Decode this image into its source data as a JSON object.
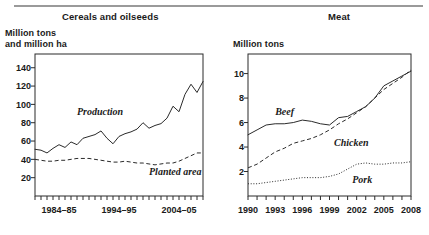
{
  "figure": {
    "width": 429,
    "height": 235,
    "background": "#ffffff",
    "rule_color": "#9a9a9a",
    "ink_color": "#2b2b2b"
  },
  "panels": {
    "left": {
      "title": "Cereals and oilseeds",
      "y_axis_label": "Million tons\nand million ha"
    },
    "right": {
      "title": "Meat",
      "y_axis_label": "Million tons"
    }
  },
  "chart_data": [
    {
      "type": "line",
      "title": "Cereals and oilseeds",
      "xlabel": "",
      "ylabel": "Million tons and million ha",
      "grid": false,
      "legend": "inline-annotations",
      "xlim": [
        1980,
        2008
      ],
      "ylim": [
        0,
        155
      ],
      "yticks": [
        20,
        40,
        60,
        80,
        100,
        120,
        140
      ],
      "ytick_labels": [
        "20",
        "40",
        "60",
        "80",
        "100",
        "120",
        "140"
      ],
      "x": [
        1980,
        1981,
        1982,
        1983,
        1984,
        1985,
        1986,
        1987,
        1988,
        1989,
        1990,
        1991,
        1992,
        1993,
        1994,
        1995,
        1996,
        1997,
        1998,
        1999,
        2000,
        2001,
        2002,
        2003,
        2004,
        2005,
        2006,
        2007,
        2008
      ],
      "xtick_labels": [
        "1984–85",
        "1994–95",
        "2004–05"
      ],
      "xtick_label_positions": [
        1984,
        1994,
        2004
      ],
      "xtick_note": "minor ticks every year across full range",
      "series": [
        {
          "name": "Production",
          "style": "solid",
          "values": [
            51,
            50,
            47,
            52,
            56,
            53,
            59,
            56,
            63,
            65,
            67,
            71,
            63,
            57,
            65,
            68,
            70,
            73,
            80,
            74,
            77,
            79,
            85,
            98,
            92,
            111,
            122,
            113,
            125,
            139
          ]
        },
        {
          "name": "Planted area",
          "style": "dashed",
          "values": [
            40,
            39,
            38,
            38,
            39,
            39,
            40,
            41,
            41,
            41,
            40,
            39,
            38,
            37,
            37,
            38,
            37,
            36,
            36,
            35,
            34,
            35,
            36,
            36,
            38,
            41,
            44,
            47,
            47,
            46
          ]
        }
      ],
      "annotations": [
        {
          "text": "Production",
          "x": 1987,
          "y": 88
        },
        {
          "text": "Planted area",
          "x": 1999,
          "y": 23
        }
      ]
    },
    {
      "type": "line",
      "title": "Meat",
      "xlabel": "",
      "ylabel": "Million tons",
      "grid": false,
      "legend": "inline-annotations",
      "xlim": [
        1990,
        2008
      ],
      "ylim": [
        0,
        11.6
      ],
      "yticks": [
        2,
        4,
        6,
        8,
        10
      ],
      "ytick_labels": [
        "2",
        "4",
        "6",
        "8",
        "10"
      ],
      "x": [
        1990,
        1991,
        1992,
        1993,
        1994,
        1995,
        1996,
        1997,
        1998,
        1999,
        2000,
        2001,
        2002,
        2003,
        2004,
        2005,
        2006,
        2007,
        2008
      ],
      "xtick_labels": [
        "1990",
        "1993",
        "1996",
        "1999",
        "2002",
        "2005",
        "2008"
      ],
      "xtick_label_positions": [
        1990,
        1993,
        1996,
        1999,
        2002,
        2005,
        2008
      ],
      "xtick_note": "minor ticks every year",
      "series": [
        {
          "name": "Beef",
          "style": "solid",
          "values": [
            5.0,
            5.4,
            5.8,
            5.9,
            5.9,
            6.0,
            6.2,
            6.1,
            5.9,
            5.8,
            6.4,
            6.5,
            6.9,
            7.3,
            8.0,
            9.0,
            9.4,
            9.8,
            10.2,
            10.2
          ]
        },
        {
          "name": "Chicken",
          "style": "dashed",
          "values": [
            2.3,
            2.6,
            3.1,
            3.6,
            3.9,
            4.3,
            4.5,
            4.7,
            5.0,
            5.4,
            5.9,
            6.3,
            6.8,
            7.3,
            8.0,
            8.7,
            9.2,
            9.7,
            10.3,
            11.0
          ]
        },
        {
          "name": "Pork",
          "style": "dotted",
          "values": [
            1.0,
            1.0,
            1.1,
            1.2,
            1.3,
            1.4,
            1.5,
            1.5,
            1.5,
            1.6,
            1.8,
            2.2,
            2.6,
            2.7,
            2.6,
            2.6,
            2.7,
            2.7,
            2.8,
            2.9
          ]
        }
      ],
      "annotations": [
        {
          "text": "Beef",
          "x": 1993,
          "y": 6.6
        },
        {
          "text": "Chicken",
          "x": 1999.5,
          "y": 4.1
        },
        {
          "text": "Pork",
          "x": 2001.5,
          "y": 1.1
        }
      ]
    }
  ]
}
